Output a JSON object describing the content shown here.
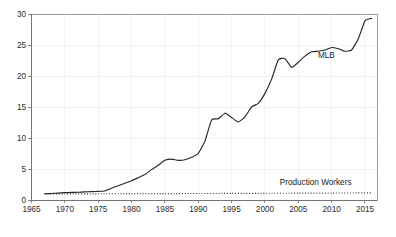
{
  "chart_data": {
    "type": "line",
    "title": "",
    "subtitle": "",
    "xlabel": "",
    "ylabel": "",
    "xlim": [
      1965,
      2016.8
    ],
    "ylim": [
      0,
      30
    ],
    "xticks": [
      1965,
      1970,
      1975,
      1980,
      1985,
      1990,
      1995,
      2000,
      2005,
      2010,
      2015
    ],
    "xtick_labels": [
      "1965",
      "1970",
      "1975",
      "1980",
      "1985",
      "1990",
      "1995",
      "2000",
      "2005",
      "2010",
      "2015"
    ],
    "yticks": [
      0,
      5,
      10,
      15,
      20,
      25,
      30
    ],
    "ytick_labels": [
      "0",
      "5",
      "10",
      "15",
      "20",
      "25",
      "30"
    ],
    "grid": true,
    "grid_color": "#e9e9ec",
    "legend": "inline-annotations",
    "frame_color": "#8c8c8c",
    "background": "#ffffff",
    "annotations": [
      {
        "text": "MLB",
        "x": 2009.2,
        "y": 22.9
      },
      {
        "text": "Production Workers",
        "x": 2007.6,
        "y": 2.35
      }
    ],
    "series": [
      {
        "name": "MLB",
        "style": "solid",
        "color": "#262626",
        "x": [
          1967,
          1968,
          1969,
          1970,
          1971,
          1972,
          1973,
          1974,
          1975,
          1976,
          1977,
          1978,
          1979,
          1980,
          1981,
          1982,
          1983,
          1984,
          1985,
          1986,
          1987,
          1988,
          1989,
          1990,
          1991,
          1992,
          1993,
          1994,
          1995,
          1996,
          1997,
          1998,
          1999,
          2000,
          2001,
          2002,
          2003,
          2004,
          2005,
          2006,
          2007,
          2008,
          2009,
          2010,
          2011,
          2012,
          2013,
          2014,
          2015,
          2016
        ],
        "values": [
          1.0,
          1.05,
          1.12,
          1.18,
          1.22,
          1.25,
          1.3,
          1.35,
          1.4,
          1.45,
          1.9,
          2.3,
          2.7,
          3.1,
          3.6,
          4.1,
          4.9,
          5.6,
          6.4,
          6.6,
          6.4,
          6.5,
          6.9,
          7.5,
          9.5,
          12.9,
          13.1,
          14.0,
          13.3,
          12.6,
          13.4,
          15.0,
          15.6,
          17.2,
          19.5,
          22.6,
          22.8,
          21.4,
          22.2,
          23.2,
          23.9,
          24.0,
          24.2,
          24.6,
          24.4,
          24.0,
          24.2,
          26.0,
          28.9,
          29.3
        ]
      },
      {
        "name": "Production Workers",
        "style": "dotted",
        "color": "#1f1f1f",
        "x": [
          1967,
          1970,
          1975,
          1980,
          1985,
          1990,
          1995,
          2000,
          2005,
          2010,
          2016
        ],
        "values": [
          1.0,
          1.0,
          1.0,
          1.02,
          1.03,
          1.05,
          1.06,
          1.08,
          1.1,
          1.12,
          1.15
        ]
      }
    ]
  }
}
